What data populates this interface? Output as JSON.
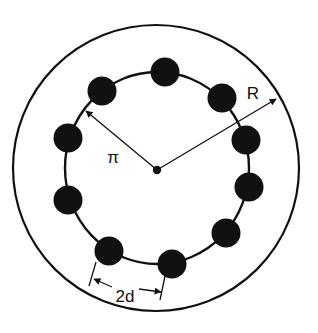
{
  "diagram": {
    "colors": {
      "ink": "#111111",
      "background": "#ffffff"
    },
    "outer_circle": {
      "cx": 156,
      "cy": 168,
      "r": 143
    },
    "ring": {
      "cx": 157,
      "cy": 168,
      "rx": 92,
      "ry": 96
    },
    "center_dot": {
      "cx": 157,
      "cy": 170,
      "r": 4
    },
    "beads": [
      {
        "id": "bead-top",
        "cx": 165,
        "cy": 72,
        "r": 14
      },
      {
        "id": "bead-upper-right",
        "cx": 222,
        "cy": 98,
        "r": 14
      },
      {
        "id": "bead-right-1",
        "cx": 246,
        "cy": 140,
        "r": 14
      },
      {
        "id": "bead-right-2",
        "cx": 249,
        "cy": 187,
        "r": 14
      },
      {
        "id": "bead-lower-right",
        "cx": 226,
        "cy": 233,
        "r": 14
      },
      {
        "id": "bead-bottom-right",
        "cx": 172,
        "cy": 264,
        "r": 14
      },
      {
        "id": "bead-bottom-left",
        "cx": 109,
        "cy": 251,
        "r": 14
      },
      {
        "id": "bead-left-2",
        "cx": 68,
        "cy": 200,
        "r": 14
      },
      {
        "id": "bead-left-1",
        "cx": 68,
        "cy": 138,
        "r": 14
      },
      {
        "id": "bead-upper-left",
        "cx": 102,
        "cy": 91,
        "r": 14
      }
    ],
    "labels": {
      "inner_radius": "π",
      "outer_radius": "R",
      "spacing": "2d"
    },
    "dimension_lines": {
      "inner_radius_arrow": {
        "x1": 157,
        "y1": 170,
        "x2": 86,
        "y2": 111
      },
      "outer_radius_arrow": {
        "x1": 157,
        "y1": 170,
        "x2": 276,
        "y2": 99
      },
      "spacing_tick_left": {
        "x1": 96,
        "y1": 262,
        "x2": 89,
        "y2": 286
      },
      "spacing_tick_right": {
        "x1": 165,
        "y1": 276,
        "x2": 160,
        "y2": 300
      }
    }
  }
}
